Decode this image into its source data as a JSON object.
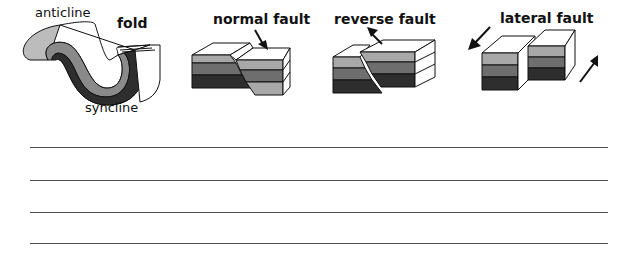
{
  "diagrams": [
    {
      "id": "fold",
      "title": "fold",
      "labels": [
        "anticline",
        "syncline"
      ]
    },
    {
      "id": "normal-fault",
      "title": "normal  fault"
    },
    {
      "id": "reverse-fault",
      "title": "reverse  fault"
    },
    {
      "id": "lateral-fault",
      "title": "lateral  fault"
    }
  ],
  "layer_colors": {
    "top": "#a8a8a8",
    "middle": "#6e6e6e",
    "bottom": "#2e2e2e",
    "face": "#ffffff",
    "outline": "#111111"
  },
  "answer_lines": {
    "count": 4,
    "y_positions": [
      147,
      180,
      212,
      243
    ]
  }
}
